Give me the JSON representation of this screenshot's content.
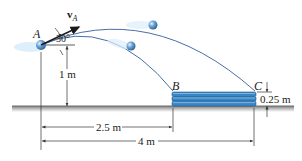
{
  "figure": {
    "points": {
      "A": "A",
      "B": "B",
      "C": "C"
    },
    "velocity_label": "v",
    "velocity_subscript": "A",
    "angle_label": "30°",
    "dimensions": {
      "launch_height": "1 m",
      "stack_height": "0.25 m",
      "distance_to_B": "2.5 m",
      "distance_to_C": "4 m"
    },
    "colors": {
      "trajectory": "#4a6fa5",
      "ball": "#5b93c9",
      "ball_highlight": "#cfe6fa",
      "stack": "#3a86c4",
      "stack_dark": "#1f5e92",
      "ground": "#8a8a8a",
      "ground_shadow": "#c8c8c8",
      "dim_line": "#333333"
    }
  }
}
